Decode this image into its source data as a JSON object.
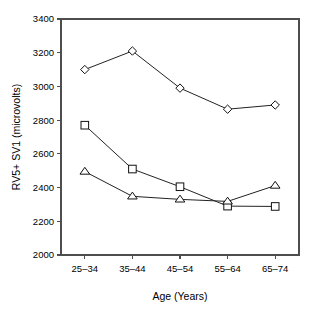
{
  "chart_data": {
    "type": "line",
    "title": "",
    "xlabel": "Age (Years)",
    "ylabel": "RV5+ SV1 (microvolts)",
    "categories": [
      "25–34",
      "35–44",
      "45–54",
      "55–64",
      "65–74"
    ],
    "yticks": [
      "2000",
      "2200",
      "2400",
      "2600",
      "2800",
      "3000",
      "3200",
      "3400"
    ],
    "ytick_values": [
      2000,
      2200,
      2400,
      2600,
      2800,
      3000,
      3200,
      3400
    ],
    "ylim": [
      2000,
      3400
    ],
    "grid": false,
    "legend": "none",
    "series": [
      {
        "name": "diamond-series",
        "marker": "diamond",
        "values": [
          3100,
          3210,
          2990,
          2865,
          2890
        ]
      },
      {
        "name": "square-series",
        "marker": "square",
        "values": [
          2770,
          2510,
          2405,
          2290,
          2288
        ]
      },
      {
        "name": "triangle-series",
        "marker": "triangle",
        "values": [
          2495,
          2348,
          2330,
          2318,
          2412
        ]
      }
    ]
  },
  "axis": {
    "x_title": "Age (Years)",
    "y_title": "RV5+ SV1 (microvolts)"
  }
}
